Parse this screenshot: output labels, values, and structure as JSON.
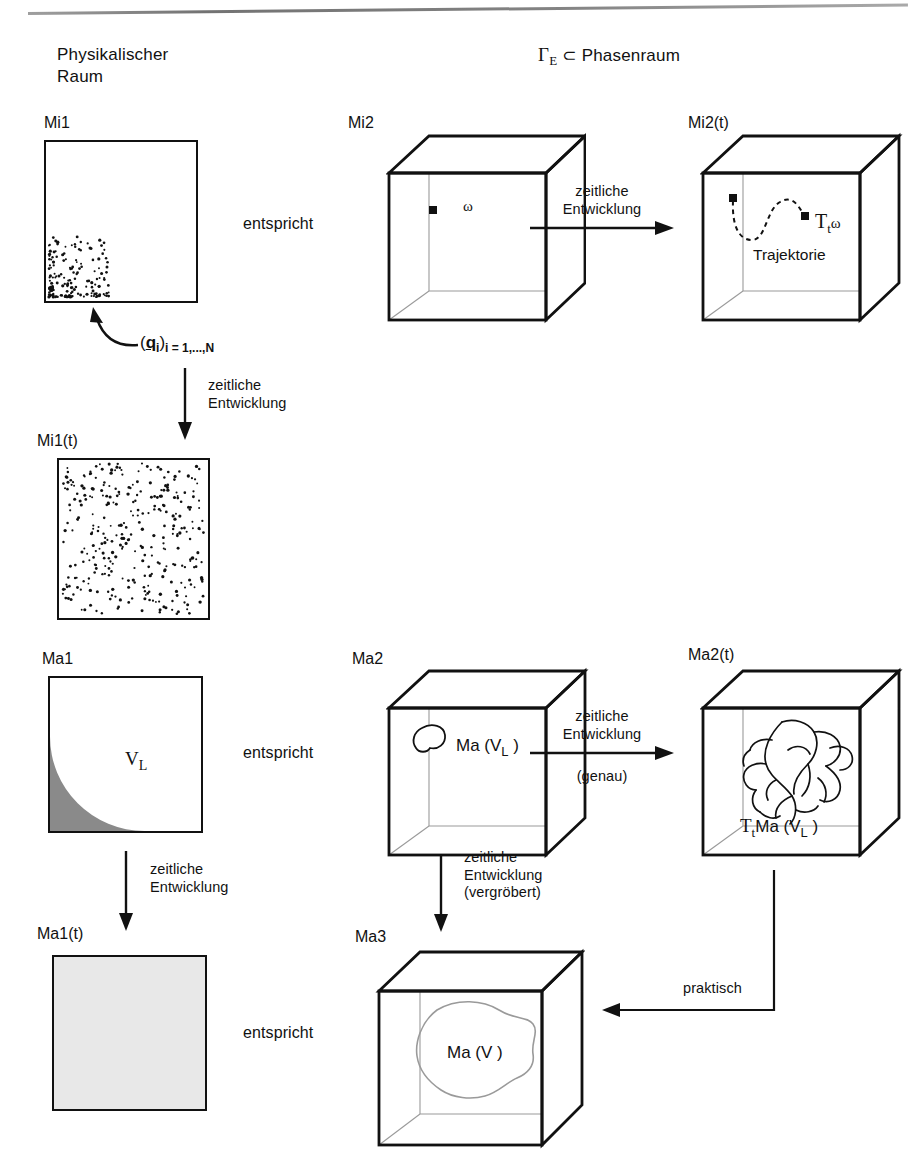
{
  "headers": {
    "left_line1": "Physikalischer",
    "left_line2": "Raum",
    "right": "Γ",
    "right_sub": "E",
    "right_rest": "⊂ Phasenraum"
  },
  "panels": {
    "mi1": {
      "title": "Mi1",
      "type": "square-dots",
      "distribution": "clustered-bottom-left"
    },
    "mi1t": {
      "title": "Mi1(t)",
      "type": "square-dots",
      "distribution": "uniform"
    },
    "mi2": {
      "title": "Mi2",
      "type": "cube",
      "point_label": "ω"
    },
    "mi2t": {
      "title": "Mi2(t)",
      "type": "cube",
      "curve_label": "Trajektorie",
      "end_label_main": "T",
      "end_label_sub": "t",
      "end_label_tail": "ω"
    },
    "ma1": {
      "title": "Ma1",
      "type": "square-region",
      "region_label_main": "V",
      "region_label_sub": "L"
    },
    "ma1t": {
      "title": "Ma1(t)",
      "type": "square-filled"
    },
    "ma2": {
      "title": "Ma2",
      "type": "cube",
      "blob_label_pre": "Ma (V",
      "blob_label_sub": "L",
      "blob_label_post": " )"
    },
    "ma2t": {
      "title": "Ma2(t)",
      "type": "cube",
      "blob_label_main": "T",
      "blob_label_sub": "t",
      "blob_label_mid": "Ma (V",
      "blob_label_sub2": "L",
      "blob_label_post": " )"
    },
    "ma3": {
      "title": "Ma3",
      "type": "cube",
      "blob_label_pre": "Ma (V",
      "blob_label_post": " )"
    }
  },
  "arrows": {
    "entspricht_1": "entspricht",
    "entspricht_2": "entspricht",
    "entspricht_3": "entspricht",
    "qi_label_open": "(",
    "qi_label_q": "q",
    "qi_label_i": "i",
    "qi_label_close": ")",
    "qi_label_sub": "i = 1,...,N",
    "zeitliche": "zeitliche",
    "entwicklung": "Entwicklung",
    "genau": "(genau)",
    "vergroebert": "(vergröbert)",
    "praktisch": "praktisch"
  },
  "colors": {
    "ink": "#111111",
    "hidden_edge": "#9a9a9a",
    "region_fill": "#8a8a8a",
    "light_fill": "#e8e8e8"
  }
}
